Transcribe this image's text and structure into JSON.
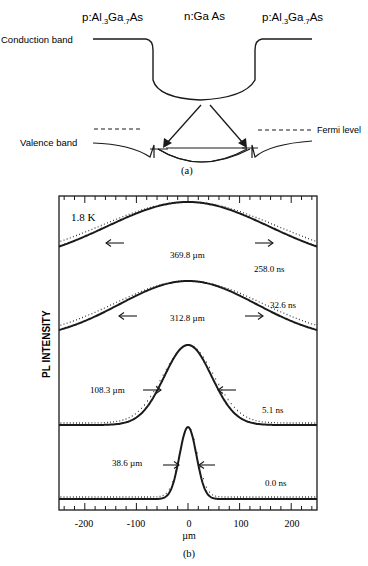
{
  "panel_a": {
    "caption": "(a)",
    "layers": {
      "left": {
        "prefix": "p:Al",
        "sub1": ".3",
        "mid": "Ga",
        "sub2": ".7",
        "suffix": "As"
      },
      "center": "n:Ga As",
      "right": {
        "prefix": "p:Al",
        "sub1": ".3",
        "mid": "Ga",
        "sub2": ".7",
        "suffix": "As"
      }
    },
    "labels": {
      "conduction_band": "Conduction band",
      "valence_band": "Valence band",
      "fermi_level": "Fermi level"
    }
  },
  "panel_b": {
    "caption": "(b)",
    "temperature": "1.8 K",
    "ylabel": "PL INTENSITY",
    "xlabel": "µm",
    "xticks": [
      "-200",
      "-100",
      "0",
      "100",
      "200"
    ],
    "curves": [
      {
        "time": "258.0 ns",
        "fwhm": "369.8 µm"
      },
      {
        "time": "32.6 ns",
        "fwhm": "312.8 µm"
      },
      {
        "time": "5.1 ns",
        "fwhm": "108.3 µm"
      },
      {
        "time": "0.0 ns",
        "fwhm": "38.6 µm"
      }
    ]
  },
  "chart_data": {
    "type": "line",
    "title": "",
    "xlabel": "µm",
    "ylabel": "PL INTENSITY",
    "xlim": [
      -250,
      250
    ],
    "xticks": [
      -200,
      -100,
      0,
      100,
      200
    ],
    "annotation": "1.8 K",
    "legend": "none",
    "grid": false,
    "series": [
      {
        "name": "258.0 ns",
        "shape": "gaussian",
        "center": 0,
        "fwhm_um": 369.8,
        "style": "solid fit with dotted data"
      },
      {
        "name": "32.6 ns",
        "shape": "gaussian",
        "center": 0,
        "fwhm_um": 312.8,
        "style": "solid fit with dotted data"
      },
      {
        "name": "5.1 ns",
        "shape": "gaussian",
        "center": 0,
        "fwhm_um": 108.3,
        "style": "solid fit with dotted data"
      },
      {
        "name": "0.0 ns",
        "shape": "gaussian",
        "center": 0,
        "fwhm_um": 38.6,
        "style": "solid fit with dotted data"
      }
    ]
  }
}
